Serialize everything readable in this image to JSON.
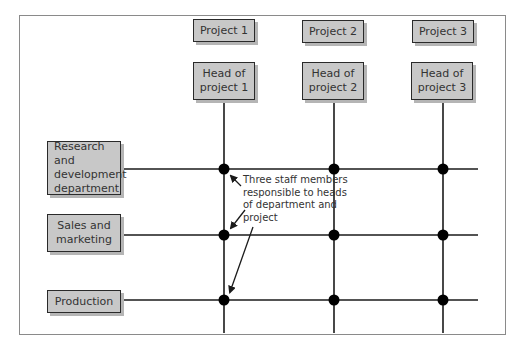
{
  "diagram": {
    "type": "matrix-organisation-structure",
    "projects": [
      {
        "label": "Project 1",
        "head": "Head of\nproject 1"
      },
      {
        "label": "Project 2",
        "head": "Head of\nproject 2"
      },
      {
        "label": "Project 3",
        "head": "Head of\nproject 3"
      }
    ],
    "departments": [
      {
        "label": "Research and\ndevelopment\ndepartment"
      },
      {
        "label": "Sales and\nmarketing"
      },
      {
        "label": "Production"
      }
    ],
    "annotation": "Three staff members\nresponsible to heads\nof department and\nproject",
    "colors": {
      "box_fill": "#c8c8c8",
      "box_border": "#2a2a2a",
      "line": "#1a1a1a",
      "node": "#000000",
      "frame": "#8a8a8a"
    }
  }
}
